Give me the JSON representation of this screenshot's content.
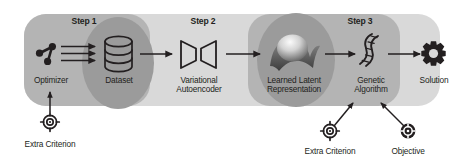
{
  "figure": {
    "background_color": "#ffffff"
  },
  "palette": {
    "band": "#d9d9d9",
    "step_block": "#b3b3b3",
    "blob": "#9a9a9a",
    "ink": "#231f20",
    "surface_light": "#efefef",
    "surface_dark": "#6f6f6f"
  },
  "steps": [
    {
      "id": "step-1",
      "label": "Step 1"
    },
    {
      "id": "step-2",
      "label": "Step 2"
    },
    {
      "id": "step-3",
      "label": "Step 3"
    }
  ],
  "nodes": [
    {
      "id": "optimizer",
      "label": "Optimizer",
      "icon": "node-graph-icon"
    },
    {
      "id": "dataset",
      "label": "Dataset",
      "icon": "database-cylinder-icon"
    },
    {
      "id": "vae",
      "label": "Variational\nAutoencoder",
      "icon": "autoencoder-hourglass-icon"
    },
    {
      "id": "latent",
      "label": "Learned Latent\nRepresentation",
      "icon": "latent-manifold-surface-icon"
    },
    {
      "id": "genetic",
      "label": "Genetic\nAlgorithm",
      "icon": "dna-helix-icon"
    },
    {
      "id": "solution",
      "label": "Solution",
      "icon": "gear-icon"
    }
  ],
  "inputs": [
    {
      "id": "extra-criterion-left",
      "label": "Extra Criterion",
      "icon": "crosshair-target-icon",
      "target": "optimizer"
    },
    {
      "id": "extra-criterion-right",
      "label": "Extra Criterion",
      "icon": "crosshair-target-icon",
      "target": "genetic"
    },
    {
      "id": "objective",
      "label": "Objective",
      "icon": "objective-target-icon",
      "target": "genetic"
    }
  ],
  "flow": {
    "optimizer_to_dataset_arrows": 3,
    "connections": [
      "optimizer -> dataset",
      "dataset -> vae",
      "vae -> latent",
      "latent -> genetic",
      "genetic -> solution"
    ]
  }
}
